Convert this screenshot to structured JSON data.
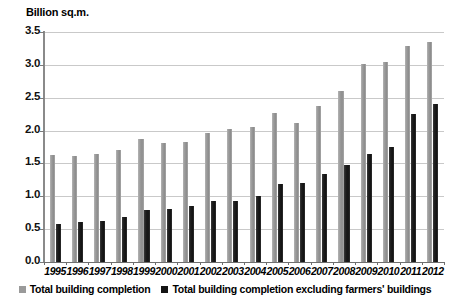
{
  "chart_data": {
    "type": "bar",
    "title": "Billion sq.m.",
    "xlabel": "",
    "ylabel": "Billion sq.m.",
    "ylim": [
      0.0,
      3.5
    ],
    "ytick_step": 0.5,
    "grid": true,
    "legend_position": "bottom",
    "categories": [
      "1995",
      "1996",
      "1997",
      "1998",
      "1999",
      "2000",
      "2001",
      "2002",
      "2003",
      "2004",
      "2005",
      "2006",
      "2007",
      "2008",
      "2009",
      "2010",
      "2011",
      "2012"
    ],
    "ytick_labels": [
      "3.5",
      "3.0",
      "2.5",
      "2.0",
      "1.5",
      "1.0",
      "0.5",
      "0.0"
    ],
    "ytick_values": [
      3.5,
      3.0,
      2.5,
      2.0,
      1.5,
      1.0,
      0.5,
      0.0
    ],
    "series": [
      {
        "name": "Total building completion",
        "color": "#9a9a9a",
        "values": [
          1.63,
          1.61,
          1.65,
          1.7,
          1.87,
          1.81,
          1.82,
          1.97,
          2.02,
          2.06,
          2.27,
          2.12,
          2.38,
          2.6,
          3.02,
          3.04,
          3.29,
          3.35
        ]
      },
      {
        "name": "Total building completion excluding farmers' buildings",
        "color": "#141414",
        "values": [
          0.58,
          0.61,
          0.62,
          0.69,
          0.79,
          0.8,
          0.85,
          0.93,
          0.93,
          1.01,
          1.18,
          1.21,
          1.34,
          1.47,
          1.64,
          1.75,
          2.26,
          2.41
        ]
      }
    ]
  },
  "legend": {
    "items": [
      {
        "label": "Total building completion",
        "swatch": "gray-swatch-icon"
      },
      {
        "label": "Total building completion excluding farmers' buildings",
        "swatch": "dark-swatch-icon"
      }
    ]
  }
}
